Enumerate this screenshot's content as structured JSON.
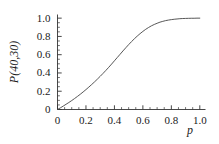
{
  "chart_data": {
    "type": "line",
    "title": "",
    "xlabel": "p",
    "ylabel": "P(40,30)",
    "xlim": [
      0,
      1.04
    ],
    "ylim": [
      0,
      1.04
    ],
    "grid": false,
    "legend": null,
    "x_ticks": [
      {
        "value": 0,
        "label": "0"
      },
      {
        "value": 0.2,
        "label": "0.2"
      },
      {
        "value": 0.4,
        "label": "0.4"
      },
      {
        "value": 0.6,
        "label": "0.6"
      },
      {
        "value": 0.8,
        "label": "0.8"
      },
      {
        "value": 1.0,
        "label": "1.0"
      }
    ],
    "y_ticks": [
      {
        "value": 0,
        "label": "0"
      },
      {
        "value": 0.2,
        "label": "0.2"
      },
      {
        "value": 0.4,
        "label": "0.4"
      },
      {
        "value": 0.6,
        "label": "0.6"
      },
      {
        "value": 0.8,
        "label": "0.8"
      },
      {
        "value": 1.0,
        "label": "1.0"
      }
    ],
    "minor_ticks_per_interval": 3,
    "series": [
      {
        "name": "P(40,30)",
        "color": "#444444",
        "x": [
          0.0,
          0.02,
          0.04,
          0.06,
          0.08,
          0.1,
          0.12,
          0.14,
          0.16,
          0.18,
          0.2,
          0.22,
          0.24,
          0.26,
          0.28,
          0.3,
          0.32,
          0.34,
          0.36,
          0.38,
          0.4,
          0.42,
          0.44,
          0.46,
          0.48,
          0.5,
          0.52,
          0.54,
          0.56,
          0.58,
          0.6,
          0.62,
          0.64,
          0.66,
          0.68,
          0.7,
          0.72,
          0.74,
          0.76,
          0.78,
          0.8,
          0.82,
          0.84,
          0.86,
          0.88,
          0.9,
          0.92,
          0.94,
          0.96,
          0.98,
          1.0
        ],
        "y": [
          0.0,
          0.018,
          0.037,
          0.057,
          0.077,
          0.098,
          0.12,
          0.143,
          0.167,
          0.192,
          0.218,
          0.245,
          0.273,
          0.302,
          0.332,
          0.363,
          0.395,
          0.428,
          0.462,
          0.497,
          0.533,
          0.569,
          0.605,
          0.641,
          0.676,
          0.71,
          0.743,
          0.774,
          0.803,
          0.83,
          0.855,
          0.878,
          0.898,
          0.916,
          0.931,
          0.944,
          0.956,
          0.965,
          0.973,
          0.979,
          0.984,
          0.988,
          0.991,
          0.994,
          0.996,
          0.997,
          0.998,
          0.999,
          0.999,
          1.0,
          1.0
        ]
      }
    ]
  },
  "axes": {
    "x_axis_name": "x-axis",
    "y_axis_name": "y-axis"
  }
}
